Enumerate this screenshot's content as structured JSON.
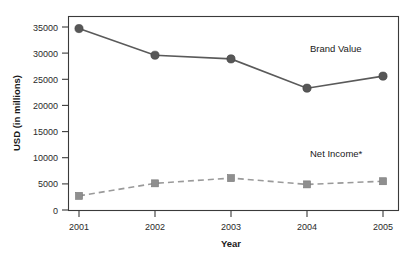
{
  "chart_data": {
    "type": "line",
    "title": "",
    "xlabel": "Year",
    "ylabel": "USD (in millions)",
    "categories": [
      "2001",
      "2002",
      "2003",
      "2004",
      "2005"
    ],
    "x": [
      2001,
      2002,
      2003,
      2004,
      2005
    ],
    "ylim": [
      0,
      35000
    ],
    "yticks": [
      0,
      5000,
      10000,
      15000,
      20000,
      25000,
      30000,
      35000
    ],
    "ytick_labels": [
      "0",
      "5000",
      "10000",
      "15000",
      "20000",
      "25000",
      "30000",
      "35000"
    ],
    "xtick_labels": [
      "2001",
      "2002",
      "2003",
      "2004",
      "2005"
    ],
    "grid": false,
    "legend_position": "inline-annotation",
    "series": [
      {
        "name": "Brand Value",
        "values": [
          34700,
          29600,
          28900,
          23300,
          25600
        ],
        "style": "solid",
        "marker": "circle",
        "color": "#575757"
      },
      {
        "name": "Net Income*",
        "values": [
          2700,
          5100,
          6100,
          4900,
          5500
        ],
        "style": "dashed",
        "marker": "square",
        "color": "#8f8f8f"
      }
    ],
    "annotations": [
      {
        "text": "Brand Value",
        "series": "Brand Value"
      },
      {
        "text": "Net Income*",
        "series": "Net Income*"
      }
    ]
  },
  "colors": {
    "brand_value": "#575757",
    "net_income": "#8f8f8f",
    "axis": "#3a3a3a",
    "background": "#ffffff"
  }
}
